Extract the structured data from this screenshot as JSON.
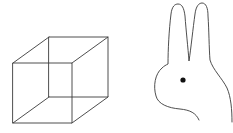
{
  "figures": [
    {
      "name": "necker-cube",
      "description": "Wireframe Necker cube",
      "front_face": [
        [
          13,
          63
        ],
        [
          72,
          63
        ],
        [
          72,
          123
        ],
        [
          13,
          123
        ]
      ],
      "back_face": [
        [
          49,
          37
        ],
        [
          108,
          37
        ],
        [
          108,
          97
        ],
        [
          49,
          97
        ]
      ]
    },
    {
      "name": "duck-rabbit",
      "description": "Ambiguous rabbit head outline with two ears and an eye",
      "eye": {
        "cx": 183,
        "cy": 80,
        "r": 2.6
      }
    }
  ],
  "colors": {
    "background": "#ffffff",
    "line": "#3a3a3a",
    "eye": "#111111"
  }
}
